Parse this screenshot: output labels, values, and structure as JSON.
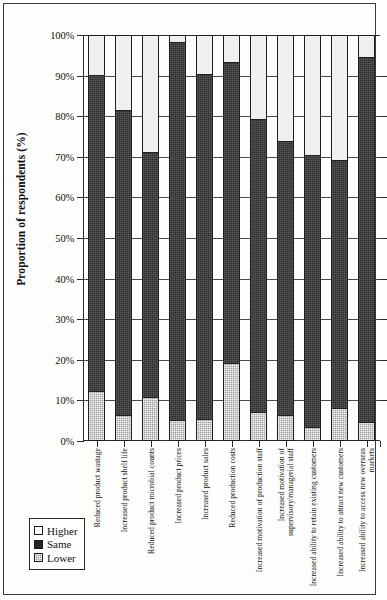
{
  "chart_data": {
    "type": "bar",
    "subtype": "stacked-100-percent",
    "title": "",
    "xlabel": "",
    "ylabel": "Proportion of respondents (%)",
    "ylim": [
      0,
      100
    ],
    "ytick_labels": [
      "100%",
      "90%",
      "80%",
      "70%",
      "60%",
      "50%",
      "40%",
      "30%",
      "20%",
      "10%",
      "0%"
    ],
    "ytick_values": [
      100,
      90,
      80,
      70,
      60,
      50,
      40,
      30,
      20,
      10,
      0
    ],
    "grid": true,
    "legend_position": "bottom-left",
    "categories": [
      "Reduced product wastage",
      "Increased product shelf life",
      "Reduced product microbial counts",
      "Increased product prices",
      "Increased product sales",
      "Reduced production costs",
      "Increased motivation of production staff",
      "Increased motivation of supervisory/managerial staff",
      "Increased ability to retain existing customers",
      "Increased ability to attract new customers",
      "Increased ability to access new overseas markets"
    ],
    "series": [
      {
        "name": "Higher",
        "color": "#efefed",
        "values": [
          9.7,
          18.3,
          28.8,
          1.4,
          9.5,
          6.4,
          20.5,
          25.9,
          29.5,
          30.8,
          5.2
        ]
      },
      {
        "name": "Same",
        "color": "#2e2e2e",
        "values": [
          78.5,
          75.7,
          60.7,
          93.8,
          85.6,
          74.8,
          72.8,
          68.2,
          67.6,
          61.5,
          90.6
        ]
      },
      {
        "name": "Lower",
        "color": "#9d9d9d",
        "values": [
          11.8,
          6.0,
          10.5,
          4.8,
          4.9,
          18.8,
          6.7,
          5.9,
          2.9,
          7.7,
          4.2
        ]
      }
    ],
    "stack_tops_same": [
      90.3,
      81.7,
      71.2,
      98.6,
      90.5,
      93.6,
      79.5,
      74.1,
      70.5,
      69.2,
      94.8
    ]
  },
  "legend": {
    "items": [
      {
        "label": "Higher",
        "swatch": "swatch-higher"
      },
      {
        "label": "Same",
        "swatch": "swatch-same"
      },
      {
        "label": "Lower",
        "swatch": "swatch-lower"
      }
    ]
  }
}
